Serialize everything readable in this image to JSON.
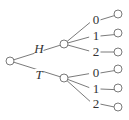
{
  "diagram": {
    "type": "tree-diagram",
    "colors": {
      "line": "#6b6b6b",
      "text": "#333333",
      "background": "#ffffff"
    },
    "root": {
      "x": 10,
      "y": 61,
      "r": 4
    },
    "level1": [
      {
        "label": "H",
        "node": {
          "x": 64,
          "y": 44
        },
        "label_pos": {
          "x": 39,
          "y": 53
        }
      },
      {
        "label": "T",
        "node": {
          "x": 64,
          "y": 78
        },
        "label_pos": {
          "x": 39,
          "y": 79
        }
      }
    ],
    "level2": [
      {
        "parent": 0,
        "label": "0",
        "label_pos": {
          "x": 96,
          "y": 24
        },
        "leaf": {
          "x": 118,
          "y": 14
        }
      },
      {
        "parent": 0,
        "label": "1",
        "label_pos": {
          "x": 96,
          "y": 40
        },
        "leaf": {
          "x": 118,
          "y": 33
        }
      },
      {
        "parent": 0,
        "label": "2",
        "label_pos": {
          "x": 96,
          "y": 56
        },
        "leaf": {
          "x": 118,
          "y": 52
        }
      },
      {
        "parent": 1,
        "label": "0",
        "label_pos": {
          "x": 96,
          "y": 77
        },
        "leaf": {
          "x": 118,
          "y": 69
        }
      },
      {
        "parent": 1,
        "label": "1",
        "label_pos": {
          "x": 96,
          "y": 93
        },
        "leaf": {
          "x": 118,
          "y": 88
        }
      },
      {
        "parent": 1,
        "label": "2",
        "label_pos": {
          "x": 96,
          "y": 108
        },
        "leaf": {
          "x": 118,
          "y": 107
        }
      }
    ]
  }
}
